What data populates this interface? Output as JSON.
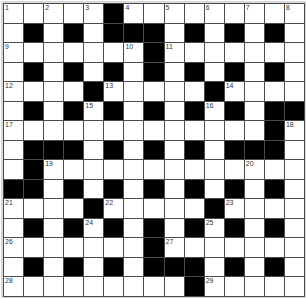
{
  "puzzle": {
    "type": "crossword",
    "size": {
      "rows": 15,
      "cols": 15
    },
    "colors": {
      "block": "#000000",
      "empty": "#ffffff",
      "gridline": "#4a4a4a",
      "number": "#333333"
    },
    "layout": [
      "..... #........",
      "x"
    ],
    "rows": [
      [
        "1",
        ".",
        "2",
        ".",
        "3",
        "#",
        "4",
        ".",
        "5",
        ".",
        "6",
        ".",
        "7",
        ".",
        "8"
      ],
      [
        ".",
        "#",
        ".",
        "#",
        ".",
        "#",
        "#",
        "#",
        ".",
        "#",
        ".",
        "#",
        ".",
        "#",
        "."
      ],
      [
        "9",
        ".",
        ".",
        ".",
        ".",
        ".",
        "10",
        "#",
        "11",
        ".",
        ".",
        ".",
        ".",
        ".",
        "."
      ],
      [
        ".",
        "#",
        ".",
        "#",
        ".",
        "#",
        ".",
        "#",
        ".",
        "#",
        ".",
        "#",
        ".",
        "#",
        "."
      ],
      [
        "12",
        ".",
        ".",
        ".",
        "#",
        "13",
        ".",
        ".",
        ".",
        ".",
        "#",
        "14",
        ".",
        ".",
        "."
      ],
      [
        ".",
        "#",
        ".",
        "#",
        "15",
        "#",
        ".",
        "#",
        ".",
        "#",
        "16",
        "#",
        ".",
        "#",
        "#"
      ],
      [
        "17",
        ".",
        ".",
        ".",
        ".",
        ".",
        ".",
        ".",
        ".",
        ".",
        ".",
        ".",
        ".",
        "#",
        "18"
      ],
      [
        ".",
        "#",
        "#",
        "#",
        ".",
        "#",
        ".",
        "#",
        ".",
        "#",
        ".",
        "#",
        "#",
        "#",
        "."
      ],
      [
        ".",
        "#",
        "19",
        ".",
        ".",
        ".",
        ".",
        ".",
        ".",
        ".",
        ".",
        ".",
        "20",
        ".",
        "."
      ],
      [
        "#",
        "#",
        ".",
        "#",
        ".",
        "#",
        ".",
        "#",
        ".",
        "#",
        ".",
        "#",
        ".",
        "#",
        "."
      ],
      [
        "21",
        ".",
        ".",
        ".",
        "#",
        "22",
        ".",
        ".",
        ".",
        ".",
        "#",
        "23",
        ".",
        ".",
        "."
      ],
      [
        ".",
        "#",
        ".",
        "#",
        "24",
        "#",
        ".",
        "#",
        ".",
        "#",
        "25",
        "#",
        ".",
        "#",
        "."
      ],
      [
        "26",
        ".",
        ".",
        ".",
        ".",
        ".",
        ".",
        "#",
        "27",
        ".",
        ".",
        ".",
        ".",
        ".",
        "."
      ],
      [
        ".",
        "#",
        ".",
        "#",
        ".",
        "#",
        ".",
        "#",
        "#",
        "#",
        ".",
        "#",
        ".",
        "#",
        "."
      ],
      [
        "28",
        ".",
        ".",
        ".",
        ".",
        ".",
        ".",
        ".",
        ".",
        "#",
        "29",
        ".",
        ".",
        ".",
        "."
      ]
    ],
    "clue_numbers": [
      "1",
      "2",
      "3",
      "4",
      "5",
      "6",
      "7",
      "8",
      "9",
      "10",
      "11",
      "12",
      "13",
      "14",
      "15",
      "16",
      "17",
      "18",
      "19",
      "20",
      "21",
      "22",
      "23",
      "24",
      "25",
      "26",
      "27",
      "28",
      "29"
    ]
  }
}
